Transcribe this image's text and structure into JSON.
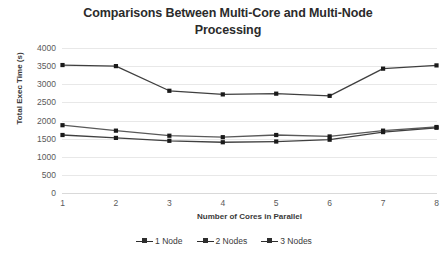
{
  "chart_data": {
    "type": "line",
    "title": "Comparisons Between Multi-Core and Multi-Node Processing",
    "title_line1": "Comparisons Between Multi-Core and Multi-Node",
    "title_line2": "Processing",
    "xlabel": "Number of Cores in Parallel",
    "ylabel": "Total Exec Time (s)",
    "categories": [
      1,
      2,
      3,
      4,
      5,
      6,
      7,
      8
    ],
    "x_tick_labels": [
      "1",
      "2",
      "3",
      "4",
      "5",
      "6",
      "7",
      "8"
    ],
    "y_tick_labels": [
      "4000",
      "3500",
      "3000",
      "2500",
      "2000",
      "1500",
      "1000",
      "500",
      "0"
    ],
    "y_ticks": [
      4000,
      3500,
      3000,
      2500,
      2000,
      1500,
      1000,
      500,
      0
    ],
    "ylim": [
      0,
      4000
    ],
    "xlim": [
      1,
      8
    ],
    "grid": true,
    "legend_position": "bottom",
    "series": [
      {
        "name": "1 Node",
        "color": "#404040",
        "values": [
          1600,
          1520,
          1440,
          1400,
          1420,
          1470,
          1680,
          1800
        ]
      },
      {
        "name": "2 Nodes",
        "color": "#595959",
        "values": [
          1870,
          1720,
          1580,
          1540,
          1600,
          1560,
          1720,
          1820
        ]
      },
      {
        "name": "3 Nodes",
        "color": "#3f3f3f",
        "values": [
          3530,
          3500,
          2820,
          2720,
          2740,
          2680,
          3430,
          3520
        ]
      }
    ]
  },
  "colors": {
    "gridline": "#e8e8e8",
    "axis_text": "#5a5a5a",
    "title_text": "#2b2b2b",
    "background": "#ffffff"
  }
}
